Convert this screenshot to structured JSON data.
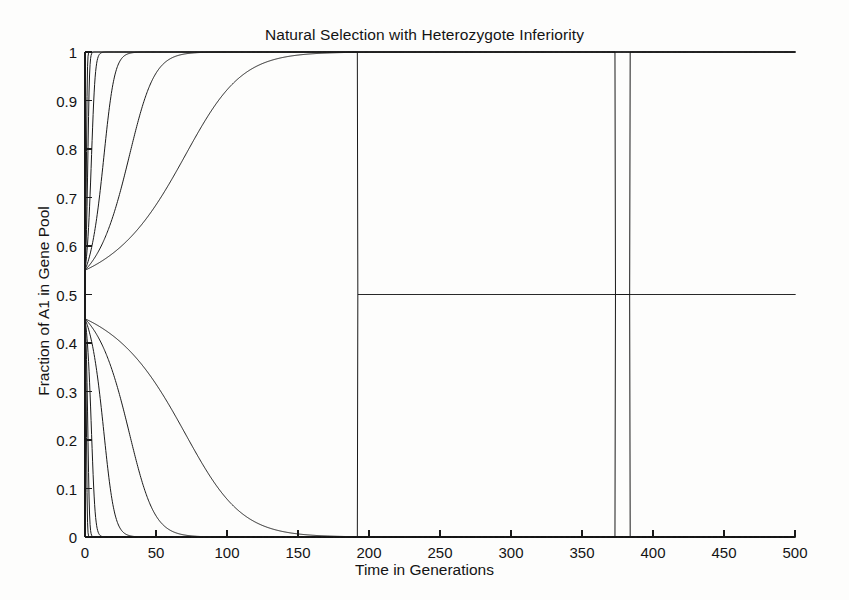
{
  "chart_data": {
    "type": "line",
    "title": "Natural Selection with Heterozygote Inferiority",
    "xlabel": "Time in Generations",
    "ylabel": "Fraction of A1 in Gene Pool",
    "xlim": [
      0,
      500
    ],
    "ylim": [
      0,
      1
    ],
    "xticks": [
      0,
      50,
      100,
      150,
      200,
      250,
      300,
      350,
      400,
      450,
      500
    ],
    "yticks": [
      0,
      0.1,
      0.2,
      0.3,
      0.4,
      0.5,
      0.6,
      0.7,
      0.8,
      0.9,
      1
    ],
    "xticklabels": [
      "0",
      "50",
      "100",
      "150",
      "200",
      "250",
      "300",
      "350",
      "400",
      "450",
      "500"
    ],
    "yticklabels": [
      "0",
      "0.1",
      "0.2",
      "0.3",
      "0.4",
      "0.5",
      "0.6",
      "0.7",
      "0.8",
      "0.9",
      "1"
    ],
    "grid": false,
    "legend": null,
    "line_color": "#1a1a1a",
    "line_width": 1.0,
    "background": "#fdfdfc",
    "unstable_equilibrium": 0.5,
    "initial_conditions": [
      0.55,
      0.45
    ],
    "series": [
      {
        "name": "s = 0.90, p0 = 0.55",
        "direction": "up",
        "p0": 0.55,
        "rate": 1.85,
        "approx_fixation_generation": 6,
        "points_x": [
          0,
          1,
          2,
          3,
          4,
          5,
          6,
          8,
          500
        ],
        "points_y": [
          0.55,
          0.72,
          0.88,
          0.96,
          0.99,
          0.998,
          1.0,
          1.0,
          1.0
        ]
      },
      {
        "name": "s = 0.70, p0 = 0.55",
        "direction": "up",
        "p0": 0.55,
        "rate": 0.95,
        "approx_fixation_generation": 12,
        "points_x": [
          0,
          2,
          4,
          6,
          8,
          10,
          12,
          16,
          500
        ],
        "points_y": [
          0.55,
          0.7,
          0.84,
          0.93,
          0.975,
          0.993,
          0.999,
          1.0,
          1.0
        ]
      },
      {
        "name": "s = 0.45, p0 = 0.55",
        "direction": "up",
        "p0": 0.55,
        "rate": 0.42,
        "approx_fixation_generation": 28,
        "points_x": [
          0,
          4,
          8,
          12,
          16,
          20,
          24,
          28,
          36,
          500
        ],
        "points_y": [
          0.55,
          0.68,
          0.8,
          0.89,
          0.945,
          0.975,
          0.991,
          0.997,
          1.0,
          1.0
        ]
      },
      {
        "name": "s = 0.20, p0 = 0.55",
        "direction": "up",
        "p0": 0.55,
        "rate": 0.145,
        "approx_fixation_generation": 80,
        "points_x": [
          0,
          10,
          20,
          30,
          40,
          50,
          60,
          70,
          80,
          100,
          500
        ],
        "points_y": [
          0.55,
          0.68,
          0.79,
          0.875,
          0.932,
          0.966,
          0.984,
          0.993,
          0.997,
          1.0,
          1.0
        ]
      },
      {
        "name": "s = 0.095, p0 = 0.55",
        "direction": "up",
        "p0": 0.55,
        "rate": 0.062,
        "approx_fixation_generation": 180,
        "points_x": [
          0,
          20,
          40,
          60,
          80,
          100,
          120,
          140,
          160,
          180,
          500
        ],
        "points_y": [
          0.55,
          0.66,
          0.755,
          0.837,
          0.898,
          0.941,
          0.967,
          0.982,
          0.991,
          0.996,
          1.0
        ]
      },
      {
        "name": "s = 0.045, p0 = 0.55",
        "direction": "up",
        "p0": 0.55,
        "rate": 0.0275,
        "approx_fixation_generation": 345,
        "points_x": [
          0,
          40,
          80,
          120,
          160,
          200,
          240,
          280,
          320,
          360,
          500
        ],
        "points_y": [
          0.55,
          0.65,
          0.74,
          0.817,
          0.878,
          0.922,
          0.952,
          0.971,
          0.983,
          0.99,
          0.999
        ]
      },
      {
        "name": "s = 0.90, p0 = 0.45",
        "direction": "down",
        "p0": 0.45,
        "rate": 1.85,
        "approx_loss_generation": 6,
        "points_x": [
          0,
          1,
          2,
          3,
          4,
          5,
          6,
          8,
          500
        ],
        "points_y": [
          0.45,
          0.28,
          0.12,
          0.04,
          0.01,
          0.002,
          0.0,
          0.0,
          0.0
        ]
      },
      {
        "name": "s = 0.70, p0 = 0.45",
        "direction": "down",
        "p0": 0.45,
        "rate": 0.95,
        "approx_loss_generation": 12,
        "points_x": [
          0,
          2,
          4,
          6,
          8,
          10,
          12,
          16,
          500
        ],
        "points_y": [
          0.45,
          0.3,
          0.16,
          0.07,
          0.025,
          0.007,
          0.001,
          0.0,
          0.0
        ]
      },
      {
        "name": "s = 0.45, p0 = 0.45",
        "direction": "down",
        "p0": 0.45,
        "rate": 0.42,
        "approx_loss_generation": 28,
        "points_x": [
          0,
          4,
          8,
          12,
          16,
          20,
          24,
          28,
          36,
          500
        ],
        "points_y": [
          0.45,
          0.32,
          0.2,
          0.11,
          0.055,
          0.025,
          0.009,
          0.003,
          0.0,
          0.0
        ]
      },
      {
        "name": "s = 0.20, p0 = 0.45",
        "direction": "down",
        "p0": 0.45,
        "rate": 0.145,
        "approx_loss_generation": 80,
        "points_x": [
          0,
          10,
          20,
          30,
          40,
          50,
          60,
          70,
          80,
          100,
          500
        ],
        "points_y": [
          0.45,
          0.32,
          0.21,
          0.125,
          0.068,
          0.034,
          0.016,
          0.007,
          0.003,
          0.0,
          0.0
        ]
      },
      {
        "name": "s = 0.095, p0 = 0.45",
        "direction": "down",
        "p0": 0.45,
        "rate": 0.062,
        "approx_loss_generation": 180,
        "points_x": [
          0,
          20,
          40,
          60,
          80,
          100,
          120,
          140,
          160,
          180,
          500
        ],
        "points_y": [
          0.45,
          0.34,
          0.245,
          0.163,
          0.102,
          0.059,
          0.033,
          0.018,
          0.009,
          0.004,
          0.0
        ]
      },
      {
        "name": "s = 0.045, p0 = 0.45",
        "direction": "down",
        "p0": 0.45,
        "rate": 0.0275,
        "approx_loss_generation": 345,
        "points_x": [
          0,
          40,
          80,
          120,
          160,
          200,
          240,
          280,
          320,
          360,
          500
        ],
        "points_y": [
          0.45,
          0.35,
          0.26,
          0.183,
          0.122,
          0.078,
          0.048,
          0.029,
          0.017,
          0.01,
          0.001
        ]
      }
    ]
  },
  "axes_geometry": {
    "left_px": 85,
    "right_px": 795,
    "top_px": 52,
    "bottom_px": 537,
    "tick_len_px": 7
  }
}
